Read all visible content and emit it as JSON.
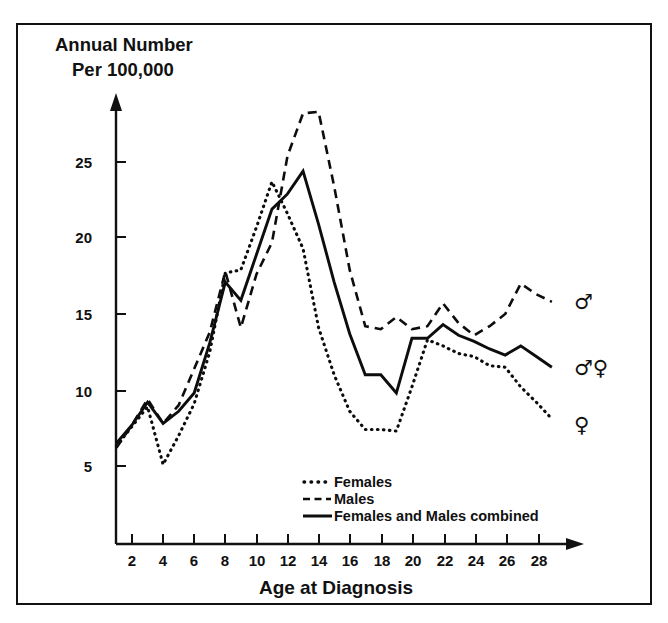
{
  "figure": {
    "header_line1": "Annual Number",
    "header_line2": "Per 100,000",
    "xlabel": "Age at Diagnosis",
    "frame_color": "#121212",
    "ink_color": "#0d0d0d"
  },
  "legend": {
    "position": "inside-bottom-center",
    "entries": [
      {
        "label": "Females",
        "style": "dotted",
        "marker": "dotted-line"
      },
      {
        "label": "Males",
        "style": "dashed",
        "marker": "dashed-line"
      },
      {
        "label": "Females and Males combined",
        "style": "solid",
        "marker": "solid-line"
      }
    ]
  },
  "end_symbols": [
    {
      "name": "male-symbol",
      "glyph": "♂",
      "series": "Males",
      "value": 15.8
    },
    {
      "name": "male-female-symbol",
      "glyph": "♂♀",
      "series": "Females and Males combined",
      "value": 11.5
    },
    {
      "name": "female-symbol",
      "glyph": "♀",
      "series": "Females",
      "value": 8.0
    }
  ],
  "chart_data": {
    "type": "line",
    "title": "Annual Number Per 100,000",
    "xlabel": "Age at Diagnosis",
    "ylabel": "Annual Number Per 100,000",
    "xlim": [
      1,
      29
    ],
    "ylim": [
      3.2,
      29.5
    ],
    "grid": false,
    "xticks": [
      2,
      4,
      6,
      8,
      10,
      12,
      14,
      16,
      18,
      20,
      22,
      24,
      26,
      28
    ],
    "yticks": [
      5,
      10,
      15,
      20,
      25
    ],
    "x": [
      1,
      2,
      3,
      4,
      5,
      6,
      7,
      8,
      9,
      10,
      11,
      12,
      13,
      14,
      15,
      16,
      17,
      18,
      19,
      20,
      21,
      22,
      23,
      24,
      25,
      26,
      27,
      28,
      29
    ],
    "series": [
      {
        "name": "Females",
        "style": "dotted",
        "values": [
          6.3,
          7.6,
          8.9,
          5.1,
          7.0,
          9.1,
          12.5,
          17.7,
          17.9,
          20.7,
          23.7,
          21.6,
          19.3,
          14.1,
          11.0,
          8.6,
          7.4,
          7.4,
          7.3,
          10.2,
          13.3,
          12.9,
          12.4,
          12.2,
          11.6,
          11.5,
          10.2,
          9.2,
          8.1
        ]
      },
      {
        "name": "Males",
        "style": "dashed",
        "values": [
          6.2,
          7.7,
          9.4,
          7.8,
          9.0,
          11.4,
          13.8,
          17.8,
          14.1,
          17.6,
          19.7,
          25.4,
          28.2,
          28.3,
          23.4,
          17.9,
          14.2,
          14.0,
          14.8,
          14.0,
          14.2,
          15.7,
          14.4,
          13.6,
          14.2,
          15.0,
          17.0,
          16.3,
          15.8
        ]
      },
      {
        "name": "Females and Males combined",
        "style": "solid",
        "values": [
          6.5,
          7.7,
          9.2,
          7.8,
          8.6,
          9.8,
          13.1,
          17.1,
          15.9,
          18.9,
          21.9,
          22.9,
          24.4,
          20.9,
          17.1,
          13.7,
          11.0,
          11.0,
          9.8,
          13.4,
          13.4,
          14.3,
          13.6,
          13.2,
          12.7,
          12.3,
          12.9,
          12.2,
          11.5
        ]
      }
    ]
  }
}
